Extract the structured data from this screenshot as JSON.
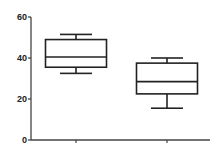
{
  "chart_data": {
    "type": "box",
    "title": "",
    "xlabel": "",
    "ylabel": "",
    "ylim": [
      0,
      60
    ],
    "yticks": [
      0,
      20,
      40,
      60
    ],
    "ytick_labels": [
      "0",
      "20",
      "40",
      "60"
    ],
    "categories": [
      "",
      ""
    ],
    "grid": false,
    "legend": null,
    "series": [
      {
        "name": "Group 1",
        "whisker_low": 32.5,
        "q1": 35.5,
        "median": 40.5,
        "q3": 49,
        "whisker_high": 51.5
      },
      {
        "name": "Group 2",
        "whisker_low": 15.5,
        "q1": 22.5,
        "median": 28.5,
        "q3": 37.5,
        "whisker_high": 40
      }
    ]
  },
  "style": {
    "line_color": "#222222",
    "axis_color": "#444444",
    "background": "#ffffff"
  }
}
